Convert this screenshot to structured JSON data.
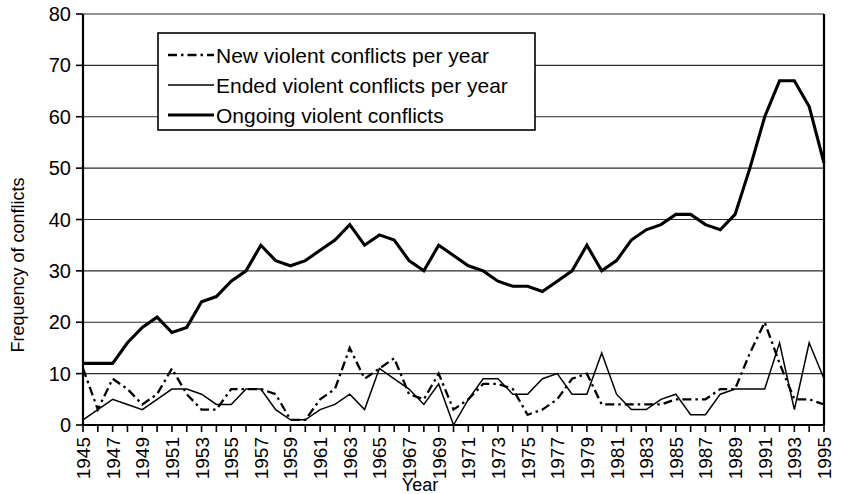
{
  "chart_data": {
    "type": "line",
    "title": "",
    "xlabel": "Year",
    "ylabel": "Frequency of conflicts",
    "xlim": [
      1945,
      1995
    ],
    "ylim": [
      0,
      80
    ],
    "ytick_step": 10,
    "yticks": [
      0,
      10,
      20,
      30,
      40,
      50,
      60,
      70,
      80
    ],
    "grid": "horizontal",
    "legend_position": "top-left-inside",
    "x": [
      1945,
      1946,
      1947,
      1948,
      1949,
      1950,
      1951,
      1952,
      1953,
      1954,
      1955,
      1956,
      1957,
      1958,
      1959,
      1960,
      1961,
      1962,
      1963,
      1964,
      1965,
      1966,
      1967,
      1968,
      1969,
      1970,
      1971,
      1972,
      1973,
      1974,
      1975,
      1976,
      1977,
      1978,
      1979,
      1980,
      1981,
      1982,
      1983,
      1984,
      1985,
      1986,
      1987,
      1988,
      1989,
      1990,
      1991,
      1992,
      1993,
      1994,
      1995
    ],
    "xtick_labels": [
      "1945",
      "1947",
      "1949",
      "1951",
      "1953",
      "1955",
      "1957",
      "1959",
      "1961",
      "1963",
      "1965",
      "1967",
      "1969",
      "1971",
      "1973",
      "1975",
      "1977",
      "1979",
      "1981",
      "1983",
      "1985",
      "1987",
      "1989",
      "1991",
      "1993",
      "1995"
    ],
    "series": [
      {
        "name": "New violent conflicts per year",
        "style": "dash-dot",
        "values": [
          11,
          3,
          9,
          7,
          4,
          6,
          11,
          6,
          3,
          3,
          7,
          7,
          7,
          6,
          1,
          1,
          5,
          7,
          15,
          9,
          11,
          13,
          6,
          5,
          10,
          3,
          5,
          8,
          8,
          7,
          2,
          3,
          5,
          9,
          10,
          4,
          4,
          4,
          4,
          4,
          5,
          5,
          5,
          7,
          7,
          14,
          20,
          12,
          5,
          5,
          4
        ]
      },
      {
        "name": "Ended violent conflicts per year",
        "style": "thin-solid",
        "values": [
          1,
          3,
          5,
          4,
          3,
          5,
          7,
          7,
          6,
          4,
          4,
          7,
          7,
          3,
          1,
          1,
          3,
          4,
          6,
          3,
          11,
          9,
          7,
          4,
          8,
          0,
          5,
          9,
          9,
          6,
          6,
          9,
          10,
          6,
          6,
          14,
          6,
          3,
          3,
          5,
          6,
          2,
          2,
          6,
          7,
          7,
          7,
          16,
          3,
          16,
          9
        ]
      },
      {
        "name": "Ongoing violent conflicts",
        "style": "thick-solid",
        "values": [
          12,
          12,
          12,
          16,
          19,
          21,
          18,
          19,
          24,
          25,
          28,
          30,
          35,
          32,
          31,
          32,
          34,
          36,
          39,
          35,
          37,
          36,
          32,
          30,
          35,
          33,
          31,
          30,
          28,
          27,
          27,
          26,
          28,
          30,
          35,
          30,
          32,
          36,
          38,
          39,
          41,
          41,
          39,
          38,
          41,
          50,
          60,
          67,
          67,
          62,
          51
        ]
      }
    ]
  },
  "legend": {
    "items": [
      {
        "label": "New violent conflicts per year",
        "style": "dash-dot"
      },
      {
        "label": "Ended violent conflicts per year",
        "style": "thin-solid"
      },
      {
        "label": "Ongoing violent conflicts",
        "style": "thick-solid"
      }
    ]
  }
}
